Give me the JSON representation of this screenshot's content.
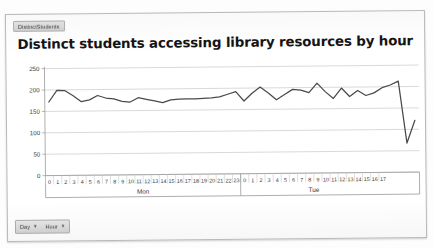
{
  "panel": {
    "sheet_tab_label": "DistinctStudents",
    "title": "Distinct students accessing library resources by hour"
  },
  "controls": {
    "day_label": "Day",
    "day_caret": "▼",
    "hour_label": "Hour",
    "hour_caret": "▼"
  },
  "colors": {
    "line": "#4a4a4a",
    "grid": "#c9c9c9",
    "axis": "#9a9a9a",
    "text": "#3a3a3a",
    "panel_border": "#b9b9b9",
    "control_bg": "#dddddd"
  },
  "chart_data": {
    "type": "line",
    "title": "Distinct students accessing library resources by hour",
    "xlabel": "",
    "ylabel": "",
    "ylim": [
      0,
      250
    ],
    "yticks": [
      0,
      50,
      100,
      150,
      200,
      250
    ],
    "grid": true,
    "legend": "none",
    "groups": [
      {
        "label": "Mon",
        "hours": [
          0,
          1,
          2,
          3,
          4,
          5,
          6,
          7,
          8,
          9,
          10,
          11,
          12,
          13,
          14,
          15,
          16,
          17,
          18,
          19,
          20,
          21,
          22,
          23
        ]
      },
      {
        "label": "Tue",
        "hours": [
          0,
          1,
          2,
          3,
          4,
          5,
          6,
          7,
          8,
          9,
          10,
          11,
          12,
          13,
          14,
          15,
          16,
          17
        ]
      }
    ],
    "categories": [
      "Mon 0",
      "Mon 1",
      "Mon 2",
      "Mon 3",
      "Mon 4",
      "Mon 5",
      "Mon 6",
      "Mon 7",
      "Mon 8",
      "Mon 9",
      "Mon 10",
      "Mon 11",
      "Mon 12",
      "Mon 13",
      "Mon 14",
      "Mon 15",
      "Mon 16",
      "Mon 17",
      "Mon 18",
      "Mon 19",
      "Mon 20",
      "Mon 21",
      "Mon 22",
      "Mon 23",
      "Tue 0",
      "Tue 1",
      "Tue 2",
      "Tue 3",
      "Tue 4",
      "Tue 5",
      "Tue 6",
      "Tue 7",
      "Tue 8",
      "Tue 9",
      "Tue 10",
      "Tue 11",
      "Tue 12",
      "Tue 13",
      "Tue 14",
      "Tue 15",
      "Tue 16",
      "Tue 17"
    ],
    "values": [
      172,
      199,
      198,
      186,
      172,
      176,
      186,
      180,
      178,
      172,
      170,
      180,
      176,
      172,
      168,
      174,
      176,
      176,
      176,
      177,
      178,
      180,
      186,
      192,
      170,
      188,
      202,
      188,
      172,
      184,
      196,
      194,
      188,
      210,
      190,
      174,
      198,
      178,
      192,
      180,
      186,
      198
    ],
    "annotations": [
      {
        "label": "Mon",
        "position": "below-axis"
      },
      {
        "label": "Tue",
        "position": "below-axis"
      }
    ]
  },
  "tail": {
    "note": "series continues after category 41 with a sharp drop then partial recovery",
    "extra_values": [
      204,
      213,
      68,
      121
    ]
  }
}
